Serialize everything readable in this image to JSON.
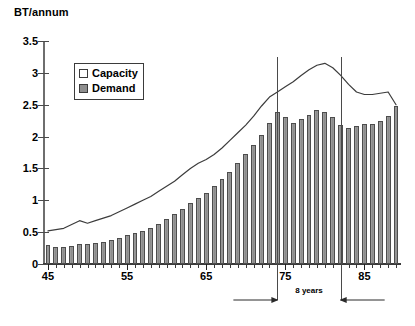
{
  "chart_data": {
    "type": "bar",
    "title": "BT/annum",
    "xlabel": "",
    "ylabel": "BT/annum",
    "ylim": [
      0,
      3.5
    ],
    "xlim": [
      45,
      89
    ],
    "ytick_labels": [
      "3.5",
      "3",
      "2.5",
      "2",
      "1.5",
      "1",
      "0.5",
      "0"
    ],
    "ytick_values": [
      3.5,
      3,
      2.5,
      2,
      1.5,
      1,
      0.5,
      0
    ],
    "xtick_labels": [
      "45",
      "55",
      "65",
      "75",
      "85"
    ],
    "xtick_values": [
      45,
      55,
      65,
      75,
      85
    ],
    "grid": false,
    "legend_position": "upper-left-inside",
    "categories": [
      45,
      46,
      47,
      48,
      49,
      50,
      51,
      52,
      53,
      54,
      55,
      56,
      57,
      58,
      59,
      60,
      61,
      62,
      63,
      64,
      65,
      66,
      67,
      68,
      69,
      70,
      71,
      72,
      73,
      74,
      75,
      76,
      77,
      78,
      79,
      80,
      81,
      82,
      83,
      84,
      85,
      86,
      87,
      88,
      89
    ],
    "series": [
      {
        "name": "Demand",
        "type": "bar",
        "color": "#8e8e8e",
        "values": [
          0.3,
          0.26,
          0.27,
          0.29,
          0.31,
          0.31,
          0.33,
          0.35,
          0.38,
          0.41,
          0.45,
          0.48,
          0.52,
          0.57,
          0.63,
          0.7,
          0.78,
          0.86,
          0.95,
          1.03,
          1.12,
          1.22,
          1.33,
          1.45,
          1.58,
          1.72,
          1.87,
          2.03,
          2.22,
          2.38,
          2.3,
          2.22,
          2.28,
          2.34,
          2.42,
          2.38,
          2.3,
          2.18,
          2.14,
          2.16,
          2.2,
          2.2,
          2.24,
          2.33,
          2.48
        ]
      },
      {
        "name": "Capacity",
        "type": "line",
        "color": "#3c3c3c",
        "values": [
          0.52,
          0.54,
          0.56,
          0.62,
          0.68,
          0.64,
          0.68,
          0.72,
          0.76,
          0.82,
          0.88,
          0.94,
          1.0,
          1.06,
          1.14,
          1.22,
          1.3,
          1.4,
          1.5,
          1.58,
          1.64,
          1.72,
          1.82,
          1.94,
          2.06,
          2.18,
          2.32,
          2.48,
          2.62,
          2.7,
          2.78,
          2.86,
          2.96,
          3.05,
          3.12,
          3.15,
          3.08,
          2.96,
          2.82,
          2.7,
          2.66,
          2.66,
          2.68,
          2.7,
          2.5
        ]
      }
    ],
    "annotations": [
      {
        "name": "span-8-years",
        "label": "8 years",
        "from_x": 74,
        "to_x": 82,
        "style": "double-arrow-with-verticals"
      }
    ]
  },
  "legend": {
    "items": [
      {
        "label": "Capacity",
        "swatch": "open-square-icon"
      },
      {
        "label": "Demand",
        "swatch": "filled-square-icon"
      }
    ]
  },
  "colors": {
    "bar_fill": "#8e8e8e",
    "bar_stroke": "#4d4d4d",
    "line": "#3c3c3c",
    "axis": "#4a4a4a",
    "text": "#000000",
    "background": "#ffffff"
  }
}
